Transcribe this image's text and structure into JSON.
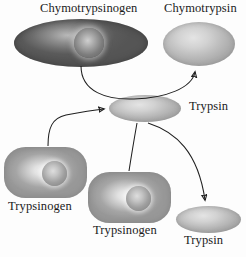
{
  "diagram": {
    "labels": {
      "chymotrypsinogen": "Chymotrypsinogen",
      "chymotrypsin": "Chymotrypsin",
      "trypsin_center": "Trypsin",
      "trypsinogen_left": "Trypsinogen",
      "trypsinogen_middle": "Trypsinogen",
      "trypsin_bottom": "Trypsin"
    },
    "colors": {
      "background": "#fdfdfd",
      "text": "#1b1b1b",
      "arrow": "#1f1f1f",
      "cell_dark": "#5a5a5a",
      "cell_mid": "#a5a5a5",
      "cell_light": "#bdbdbd"
    },
    "nodes": [
      {
        "name": "chymotrypsinogen",
        "shape": "rounded-capsule",
        "tone": "dark",
        "nucleus": true
      },
      {
        "name": "chymotrypsin",
        "shape": "ellipse",
        "tone": "light",
        "nucleus": false
      },
      {
        "name": "trypsin-center",
        "shape": "ellipse",
        "tone": "light",
        "nucleus": false
      },
      {
        "name": "trypsinogen-left",
        "shape": "rounded-rect",
        "tone": "mid",
        "nucleus": true
      },
      {
        "name": "trypsinogen-middle",
        "shape": "rounded-rect",
        "tone": "mid",
        "nucleus": true
      },
      {
        "name": "trypsin-bottom",
        "shape": "ellipse",
        "tone": "light",
        "nucleus": false
      }
    ],
    "arrows": [
      {
        "name": "chymotrypsinogen-to-chymotrypsin",
        "from": "chymotrypsinogen",
        "to": "chymotrypsin"
      },
      {
        "name": "trypsinogen-left-to-trypsin-center",
        "from": "trypsinogen-left",
        "to": "trypsin-center"
      },
      {
        "name": "trypsin-center-to-trypsin-bottom",
        "from": "trypsin-center",
        "to": "trypsin-bottom"
      },
      {
        "name": "trypsinogen-middle-to-trypsin-center",
        "from": "trypsinogen-middle",
        "to": "trypsin-center"
      }
    ]
  }
}
